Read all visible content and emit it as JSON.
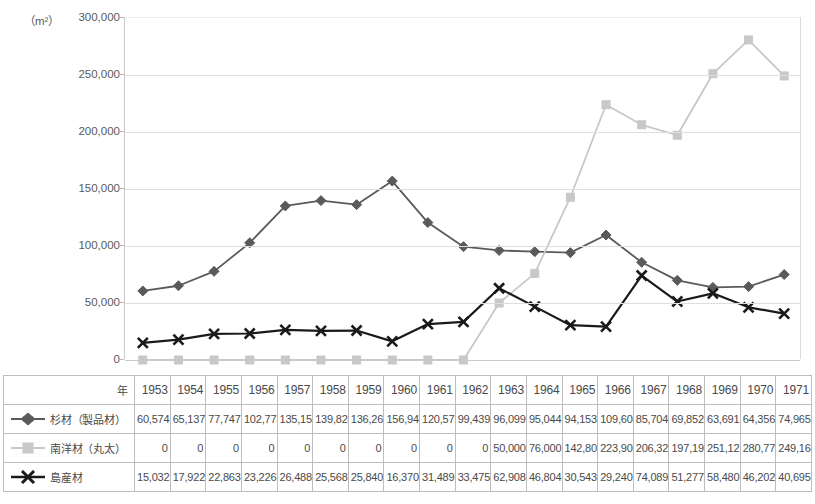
{
  "chart_data": {
    "type": "line",
    "title": "",
    "xlabel": "",
    "ylabel": "",
    "unit_label": "（m²）",
    "ylim": [
      0,
      300000
    ],
    "ytick_values": [
      0,
      50000,
      100000,
      150000,
      200000,
      250000,
      300000
    ],
    "ytick_labels": [
      "0",
      "50,000",
      "100,000",
      "150,000",
      "200,000",
      "250,000",
      "300,000"
    ],
    "grid": true,
    "legend_position": "table-row-headers",
    "categories": [
      1953,
      1954,
      1955,
      1956,
      1957,
      1958,
      1959,
      1960,
      1961,
      1962,
      1963,
      1964,
      1965,
      1966,
      1967,
      1968,
      1969,
      1970,
      1971
    ],
    "series": [
      {
        "name": "杉材（製品材）",
        "marker": "diamond",
        "color": "#5a5a5a",
        "values": [
          60574,
          65137,
          77747,
          102773,
          135155,
          139820,
          136262,
          156947,
          120572,
          99439,
          96099,
          95044,
          94153,
          109604,
          85704,
          69852,
          63691,
          64356,
          74965
        ],
        "labels": [
          "60,574",
          "65,137",
          "77,747",
          "102,773",
          "135,155",
          "139,820",
          "136,262",
          "156,947",
          "120,572",
          "99,439",
          "96,099",
          "95,044",
          "94,153",
          "109,604",
          "85,704",
          "69,852",
          "63,691",
          "64,356",
          "74,965"
        ]
      },
      {
        "name": "南洋材（丸太）",
        "marker": "square",
        "color": "#c8c8c8",
        "values": [
          0,
          0,
          0,
          0,
          0,
          0,
          0,
          0,
          0,
          0,
          50000,
          76000,
          142802,
          223906,
          206322,
          197196,
          251122,
          280775,
          249164
        ],
        "labels": [
          "0",
          "0",
          "0",
          "0",
          "0",
          "0",
          "0",
          "0",
          "0",
          "0",
          "50,000",
          "76,000",
          "142,802",
          "223,906",
          "206,322",
          "197,196",
          "251,122",
          "280,775",
          "249,164"
        ]
      },
      {
        "name": "島産材",
        "marker": "cross",
        "color": "#1a1a1a",
        "values": [
          15032,
          17922,
          22863,
          23226,
          26488,
          25568,
          25840,
          16370,
          31489,
          33475,
          62908,
          46804,
          30543,
          29240,
          74089,
          51277,
          58480,
          46202,
          40695
        ],
        "labels": [
          "15,032",
          "17,922",
          "22,863",
          "23,226",
          "26,488",
          "25,568",
          "25,840",
          "16,370",
          "31,489",
          "33,475",
          "62,908",
          "46,804",
          "30,543",
          "29,240",
          "74,089",
          "51,277",
          "58,480",
          "46,202",
          "40,695"
        ]
      }
    ]
  },
  "table": {
    "year_row_label": "年",
    "year_values": [
      "1953",
      "1954",
      "1955",
      "1956",
      "1957",
      "1958",
      "1959",
      "1960",
      "1961",
      "1962",
      "1963",
      "1964",
      "1965",
      "1966",
      "1967",
      "1968",
      "1969",
      "1970",
      "1971"
    ],
    "rows": [
      {
        "label": "杉材（製品材）",
        "marker": "diamond",
        "values": [
          "60,574",
          "65,137",
          "77,747",
          "102,773",
          "135,155",
          "139,820",
          "136,262",
          "156,947",
          "120,572",
          "99,439",
          "96,099",
          "95,044",
          "94,153",
          "109,604",
          "85,704",
          "69,852",
          "63,691",
          "64,356",
          "74,965"
        ]
      },
      {
        "label": "南洋材（丸太）",
        "marker": "square",
        "values": [
          "0",
          "0",
          "0",
          "0",
          "0",
          "0",
          "0",
          "0",
          "0",
          "0",
          "50,000",
          "76,000",
          "142,802",
          "223,906",
          "206,322",
          "197,196",
          "251,122",
          "280,775",
          "249,164"
        ]
      },
      {
        "label": "島産材",
        "marker": "cross",
        "values": [
          "15,032",
          "17,922",
          "22,863",
          "23,226",
          "26,488",
          "25,568",
          "25,840",
          "16,370",
          "31,489",
          "33,475",
          "62,908",
          "46,804",
          "30,543",
          "29,240",
          "74,089",
          "51,277",
          "58,480",
          "46,202",
          "40,695"
        ]
      }
    ]
  }
}
